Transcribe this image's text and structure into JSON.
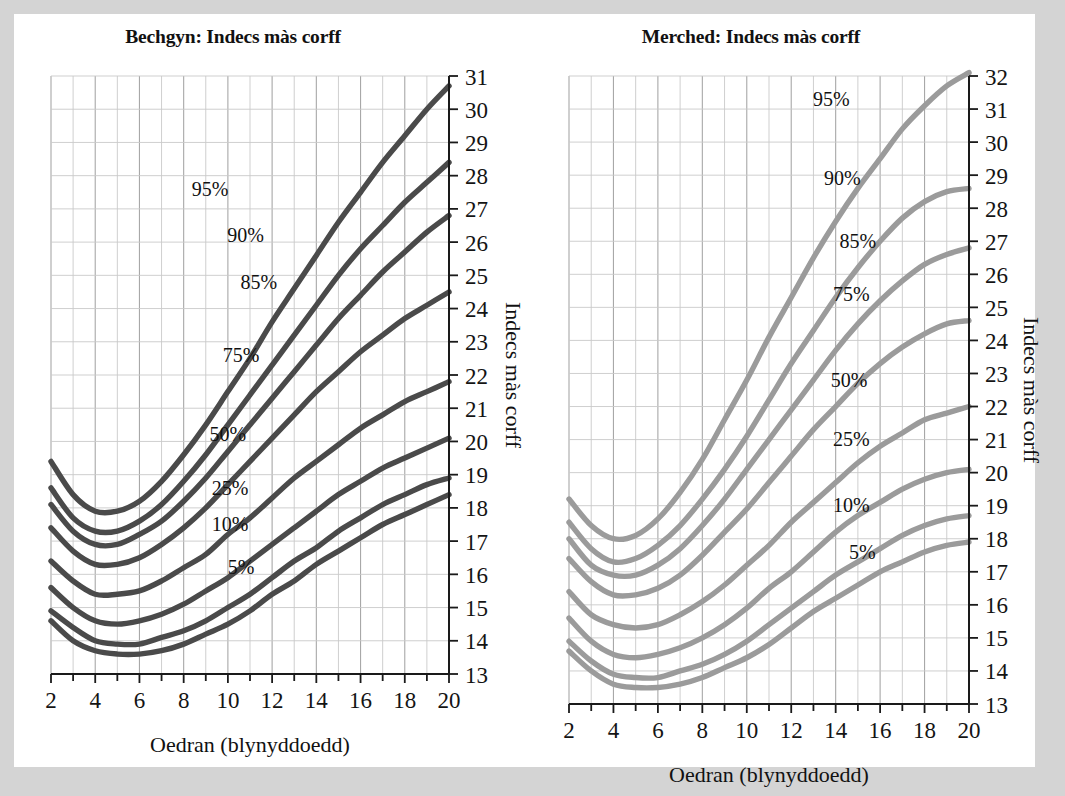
{
  "figure": {
    "background_color": "#d4d4d4",
    "card_color": "#ffffff"
  },
  "charts": [
    {
      "id": "boys",
      "title": "Bechgyn: Indecs màs corff",
      "x_axis_label": "Oedran (blynyddoedd)",
      "y_axis_label": "Indecs màs corff",
      "line_color": "#4a4a4a",
      "x_tick_labels": [
        "2",
        "4",
        "6",
        "8",
        "10",
        "12",
        "14",
        "16",
        "18",
        "20"
      ],
      "y_tick_labels": [
        "13",
        "14",
        "15",
        "16",
        "17",
        "18",
        "19",
        "20",
        "21",
        "22",
        "23",
        "24",
        "25",
        "26",
        "27",
        "28",
        "29",
        "30",
        "31"
      ]
    },
    {
      "id": "girls",
      "title": "Merched: Indecs màs corff",
      "x_axis_label": "Oedran (blynyddoedd)",
      "y_axis_label": "Indecs màs corff",
      "line_color": "#9b9b9b",
      "x_tick_labels": [
        "2",
        "4",
        "6",
        "8",
        "10",
        "12",
        "14",
        "16",
        "18",
        "20"
      ],
      "y_tick_labels": [
        "13",
        "14",
        "15",
        "16",
        "17",
        "18",
        "19",
        "20",
        "21",
        "22",
        "23",
        "24",
        "25",
        "26",
        "27",
        "28",
        "29",
        "30",
        "31",
        "32"
      ]
    }
  ],
  "chart_data": [
    {
      "type": "line",
      "id": "boys",
      "title": "Bechgyn: Indecs màs corff",
      "xlabel": "Oedran (blynyddoedd)",
      "ylabel": "Indecs màs corff",
      "xlim": [
        2,
        20
      ],
      "ylim": [
        13,
        31
      ],
      "grid": true,
      "legend_position": "inline-annotations",
      "x": [
        2,
        3,
        4,
        5,
        6,
        7,
        8,
        9,
        10,
        11,
        12,
        13,
        14,
        15,
        16,
        17,
        18,
        19,
        20
      ],
      "series": [
        {
          "name": "95%",
          "label": "95%",
          "label_x": 9.2,
          "label_y": 27.4,
          "values": [
            19.4,
            18.4,
            17.9,
            17.9,
            18.2,
            18.8,
            19.6,
            20.5,
            21.5,
            22.5,
            23.6,
            24.6,
            25.6,
            26.6,
            27.5,
            28.4,
            29.2,
            30.0,
            30.7
          ]
        },
        {
          "name": "90%",
          "label": "90%",
          "label_x": 10.8,
          "label_y": 26.0,
          "values": [
            18.6,
            17.7,
            17.3,
            17.3,
            17.6,
            18.1,
            18.8,
            19.6,
            20.5,
            21.4,
            22.3,
            23.2,
            24.1,
            25.0,
            25.8,
            26.5,
            27.2,
            27.8,
            28.4
          ]
        },
        {
          "name": "85%",
          "label": "85%",
          "label_x": 11.4,
          "label_y": 24.6,
          "values": [
            18.1,
            17.3,
            16.9,
            16.9,
            17.2,
            17.6,
            18.2,
            18.9,
            19.7,
            20.5,
            21.3,
            22.1,
            22.9,
            23.7,
            24.4,
            25.1,
            25.7,
            26.3,
            26.8
          ]
        },
        {
          "name": "75%",
          "label": "75%",
          "label_x": 10.6,
          "label_y": 22.4,
          "values": [
            17.4,
            16.7,
            16.3,
            16.3,
            16.5,
            16.9,
            17.4,
            18.0,
            18.7,
            19.4,
            20.1,
            20.8,
            21.5,
            22.1,
            22.7,
            23.2,
            23.7,
            24.1,
            24.5
          ]
        },
        {
          "name": "50%",
          "label": "50%",
          "label_x": 10.0,
          "label_y": 20.0,
          "values": [
            16.4,
            15.8,
            15.4,
            15.4,
            15.5,
            15.8,
            16.2,
            16.6,
            17.2,
            17.7,
            18.3,
            18.9,
            19.4,
            19.9,
            20.4,
            20.8,
            21.2,
            21.5,
            21.8
          ]
        },
        {
          "name": "25%",
          "label": "25%",
          "label_x": 10.1,
          "label_y": 18.4,
          "values": [
            15.6,
            15.0,
            14.6,
            14.5,
            14.6,
            14.8,
            15.1,
            15.5,
            15.9,
            16.4,
            16.9,
            17.4,
            17.9,
            18.4,
            18.8,
            19.2,
            19.5,
            19.8,
            20.1
          ]
        },
        {
          "name": "10%",
          "label": "10%",
          "label_x": 10.1,
          "label_y": 17.3,
          "values": [
            14.9,
            14.4,
            14.0,
            13.9,
            13.9,
            14.1,
            14.3,
            14.6,
            15.0,
            15.4,
            15.9,
            16.4,
            16.8,
            17.3,
            17.7,
            18.1,
            18.4,
            18.7,
            18.9
          ]
        },
        {
          "name": "5%",
          "label": "5%",
          "label_x": 10.6,
          "label_y": 16.0,
          "values": [
            14.6,
            14.0,
            13.7,
            13.6,
            13.6,
            13.7,
            13.9,
            14.2,
            14.5,
            14.9,
            15.4,
            15.8,
            16.3,
            16.7,
            17.1,
            17.5,
            17.8,
            18.1,
            18.4
          ]
        }
      ]
    },
    {
      "type": "line",
      "id": "girls",
      "title": "Merched: Indecs màs corff",
      "xlabel": "Oedran (blynyddoedd)",
      "ylabel": "Indecs màs corff",
      "xlim": [
        2,
        20
      ],
      "ylim": [
        13,
        32
      ],
      "grid": true,
      "legend_position": "inline-annotations",
      "x": [
        2,
        3,
        4,
        5,
        6,
        7,
        8,
        9,
        10,
        11,
        12,
        13,
        14,
        15,
        16,
        17,
        18,
        19,
        20
      ],
      "series": [
        {
          "name": "95%",
          "label": "95%",
          "label_x": 13.8,
          "label_y": 31.1,
          "values": [
            19.2,
            18.4,
            18.0,
            18.1,
            18.6,
            19.4,
            20.4,
            21.6,
            22.8,
            24.1,
            25.3,
            26.5,
            27.6,
            28.6,
            29.5,
            30.4,
            31.1,
            31.7,
            32.1
          ]
        },
        {
          "name": "90%",
          "label": "90%",
          "label_x": 14.3,
          "label_y": 28.7,
          "values": [
            18.5,
            17.7,
            17.3,
            17.4,
            17.8,
            18.4,
            19.2,
            20.1,
            21.1,
            22.2,
            23.3,
            24.3,
            25.3,
            26.2,
            27.0,
            27.7,
            28.2,
            28.5,
            28.6
          ]
        },
        {
          "name": "85%",
          "label": "85%",
          "label_x": 15.0,
          "label_y": 26.8,
          "values": [
            18.0,
            17.2,
            16.9,
            16.9,
            17.2,
            17.7,
            18.4,
            19.2,
            20.1,
            21.0,
            21.9,
            22.8,
            23.7,
            24.5,
            25.2,
            25.8,
            26.3,
            26.6,
            26.8
          ]
        },
        {
          "name": "75%",
          "label": "75%",
          "label_x": 14.7,
          "label_y": 25.2,
          "values": [
            17.4,
            16.7,
            16.3,
            16.3,
            16.5,
            16.9,
            17.5,
            18.2,
            18.9,
            19.7,
            20.5,
            21.3,
            22.0,
            22.7,
            23.3,
            23.8,
            24.2,
            24.5,
            24.6
          ]
        },
        {
          "name": "50%",
          "label": "50%",
          "label_x": 14.6,
          "label_y": 22.6,
          "values": [
            16.4,
            15.7,
            15.4,
            15.3,
            15.4,
            15.7,
            16.1,
            16.6,
            17.2,
            17.8,
            18.5,
            19.1,
            19.7,
            20.3,
            20.8,
            21.2,
            21.6,
            21.8,
            22.0
          ]
        },
        {
          "name": "25%",
          "label": "25%",
          "label_x": 14.7,
          "label_y": 20.8,
          "values": [
            15.6,
            14.9,
            14.5,
            14.4,
            14.5,
            14.7,
            15.0,
            15.4,
            15.9,
            16.5,
            17.0,
            17.6,
            18.2,
            18.7,
            19.1,
            19.5,
            19.8,
            20.0,
            20.1
          ]
        },
        {
          "name": "10%",
          "label": "10%",
          "label_x": 14.7,
          "label_y": 18.8,
          "values": [
            14.9,
            14.3,
            13.9,
            13.8,
            13.8,
            14.0,
            14.2,
            14.5,
            14.9,
            15.4,
            15.9,
            16.4,
            16.9,
            17.3,
            17.7,
            18.1,
            18.4,
            18.6,
            18.7
          ]
        },
        {
          "name": "5%",
          "label": "5%",
          "label_x": 15.2,
          "label_y": 17.4,
          "values": [
            14.6,
            14.0,
            13.6,
            13.5,
            13.5,
            13.6,
            13.8,
            14.1,
            14.4,
            14.8,
            15.3,
            15.8,
            16.2,
            16.6,
            17.0,
            17.3,
            17.6,
            17.8,
            17.9
          ]
        }
      ]
    }
  ]
}
